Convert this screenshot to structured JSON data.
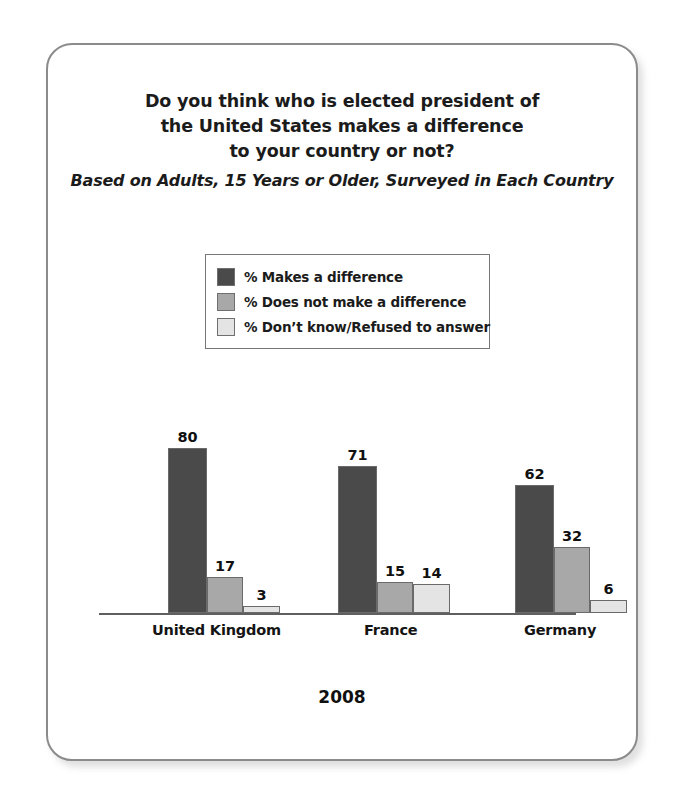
{
  "card": {
    "border_color": "#8b8b8b",
    "background": "#ffffff"
  },
  "title": {
    "line1": "Do you think who is elected president of",
    "line2": "the United States makes a difference",
    "line3": "to your country or not?",
    "subtitle": "Based on Adults, 15 Years or Older, Surveyed in Each Country"
  },
  "legend": {
    "items": [
      {
        "label": "% Makes a difference",
        "color": "#4a4a4a"
      },
      {
        "label": "% Does not make a difference",
        "color": "#a8a8a8"
      },
      {
        "label": "% Don’t know/Refused to answer",
        "color": "#e4e4e4"
      }
    ]
  },
  "caption": {
    "year": "2008"
  },
  "chart_data": {
    "type": "bar",
    "title": "Do you think who is elected president of the United States makes a difference to your country or not?",
    "subtitle": "Based on Adults, 15 Years or Older, Surveyed in Each Country",
    "xlabel": "",
    "ylabel": "",
    "ylim": [
      0,
      100
    ],
    "grid": false,
    "legend_position": "top-center",
    "annotations": [
      "2008"
    ],
    "categories": [
      "United Kingdom",
      "France",
      "Germany"
    ],
    "series": [
      {
        "name": "% Makes a difference",
        "color": "#4a4a4a",
        "values": [
          80,
          71,
          62
        ]
      },
      {
        "name": "% Does not make a difference",
        "color": "#a8a8a8",
        "values": [
          17,
          15,
          32
        ]
      },
      {
        "name": "% Don’t know/Refused to answer",
        "color": "#e4e4e4",
        "values": [
          3,
          14,
          6
        ]
      }
    ]
  }
}
